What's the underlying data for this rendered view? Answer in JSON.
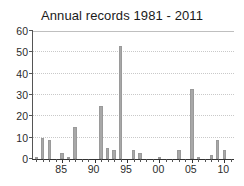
{
  "chart_data": {
    "type": "bar",
    "title": "Annual records 1981 - 2011",
    "xlabel": "",
    "ylabel": "",
    "ylim": [
      0,
      60
    ],
    "yticks": [
      0,
      10,
      20,
      30,
      40,
      50,
      60
    ],
    "ytick_labels": [
      "0",
      "10",
      "20",
      "30",
      "40",
      "50",
      "60"
    ],
    "grid": true,
    "grid_axis": "y",
    "legend": false,
    "bar_color": "#a8a8a8",
    "xlim": [
      1980.5,
      2011.5
    ],
    "xticks": [
      1985,
      1990,
      1995,
      2000,
      2005,
      2010
    ],
    "xtick_labels": [
      "85",
      "90",
      "95",
      "00",
      "05",
      "10"
    ],
    "categories": [
      "1981",
      "1982",
      "1983",
      "1984",
      "1985",
      "1986",
      "1987",
      "1988",
      "1989",
      "1990",
      "1991",
      "1992",
      "1993",
      "1994",
      "1995",
      "1996",
      "1997",
      "1998",
      "1999",
      "2000",
      "2001",
      "2002",
      "2003",
      "2004",
      "2005",
      "2006",
      "2007",
      "2008",
      "2009",
      "2010",
      "2011"
    ],
    "values": [
      1,
      10,
      9,
      0,
      3,
      1,
      15,
      0,
      0,
      0,
      25,
      5,
      4,
      53,
      0,
      4,
      3,
      0,
      0,
      1,
      0,
      0,
      4,
      0,
      33,
      1,
      0,
      2,
      9,
      4,
      0
    ]
  }
}
